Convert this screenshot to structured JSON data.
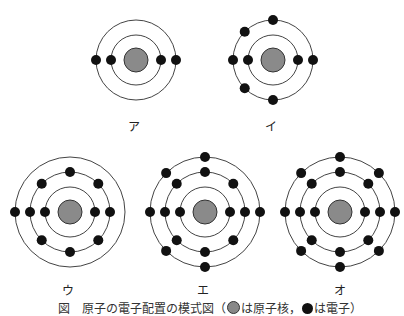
{
  "figure": {
    "caption_prefix": "図　原子の電子配置の模式図（",
    "caption_nucleus_text": "は原子核，",
    "caption_electron_text": "は電子）",
    "colors": {
      "nucleus": "#8a8a8a",
      "electron": "#111111",
      "shell": "#444444"
    }
  },
  "atoms": [
    {
      "label": "ア",
      "cx": 136,
      "cy": 60,
      "label_x": 134,
      "label_y": 117,
      "shells": [
        {
          "r": 25,
          "electrons": 2
        },
        {
          "r": 40,
          "electrons": 2
        }
      ]
    },
    {
      "label": "イ",
      "cx": 273,
      "cy": 60,
      "label_x": 271,
      "label_y": 117,
      "shells": [
        {
          "r": 25,
          "electrons": 2
        },
        {
          "r": 40,
          "electrons": 6
        }
      ]
    },
    {
      "label": "ウ",
      "cx": 70,
      "cy": 212,
      "label_x": 68,
      "label_y": 281,
      "shells": [
        {
          "r": 25,
          "electrons": 2
        },
        {
          "r": 40,
          "electrons": 8
        },
        {
          "r": 55,
          "electrons": 1
        }
      ]
    },
    {
      "label": "エ",
      "cx": 205,
      "cy": 212,
      "label_x": 203,
      "label_y": 281,
      "shells": [
        {
          "r": 25,
          "electrons": 2
        },
        {
          "r": 40,
          "electrons": 8
        },
        {
          "r": 55,
          "electrons": 6
        }
      ]
    },
    {
      "label": "オ",
      "cx": 340,
      "cy": 212,
      "label_x": 340,
      "label_y": 281,
      "shells": [
        {
          "r": 25,
          "electrons": 2
        },
        {
          "r": 40,
          "electrons": 8
        },
        {
          "r": 55,
          "electrons": 8
        }
      ]
    }
  ]
}
